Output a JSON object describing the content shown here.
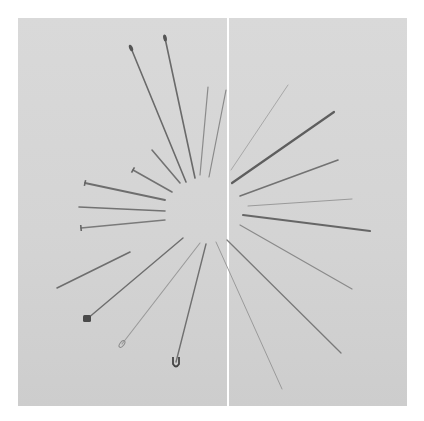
{
  "image": {
    "subject": "Assorted pins and needles arranged radially in a starburst pattern",
    "background_color": "#d6d6d6",
    "seam_color": "#ffffff",
    "needle_color": "#6e6e6e"
  },
  "needles": [
    {
      "x1": 131,
      "y1": 48,
      "x2": 186,
      "y2": 182,
      "w": 1.6,
      "c": "#6a6a6a",
      "head": "eye"
    },
    {
      "x1": 165,
      "y1": 38,
      "x2": 195,
      "y2": 178,
      "w": 1.6,
      "c": "#6a6a6a",
      "head": "eye"
    },
    {
      "x1": 208,
      "y1": 87,
      "x2": 200,
      "y2": 175,
      "w": 1.2,
      "c": "#8a8a8a",
      "head": "none"
    },
    {
      "x1": 226,
      "y1": 90,
      "x2": 209,
      "y2": 177,
      "w": 1.2,
      "c": "#8a8a8a",
      "head": "none"
    },
    {
      "x1": 152,
      "y1": 150,
      "x2": 180,
      "y2": 183,
      "w": 1.6,
      "c": "#727272",
      "head": "none"
    },
    {
      "x1": 133,
      "y1": 170,
      "x2": 172,
      "y2": 192,
      "w": 1.6,
      "c": "#727272",
      "head": "flat"
    },
    {
      "x1": 85,
      "y1": 183,
      "x2": 165,
      "y2": 200,
      "w": 1.8,
      "c": "#6e6e6e",
      "head": "flat"
    },
    {
      "x1": 79,
      "y1": 207,
      "x2": 165,
      "y2": 211,
      "w": 1.6,
      "c": "#727272",
      "head": "none"
    },
    {
      "x1": 81,
      "y1": 228,
      "x2": 165,
      "y2": 220,
      "w": 1.4,
      "c": "#7a7a7a",
      "head": "flat"
    },
    {
      "x1": 57,
      "y1": 288,
      "x2": 130,
      "y2": 252,
      "w": 1.6,
      "c": "#6e6e6e",
      "head": "none"
    },
    {
      "x1": 87,
      "y1": 319,
      "x2": 183,
      "y2": 238,
      "w": 1.4,
      "c": "#6e6e6e",
      "head": "knob"
    },
    {
      "x1": 122,
      "y1": 344,
      "x2": 200,
      "y2": 243,
      "w": 1.1,
      "c": "#9a9a9a",
      "head": "oval"
    },
    {
      "x1": 176,
      "y1": 362,
      "x2": 206,
      "y2": 244,
      "w": 1.4,
      "c": "#707070",
      "head": "safety"
    },
    {
      "x1": 231,
      "y1": 170,
      "x2": 288,
      "y2": 85,
      "w": 1.0,
      "c": "#a8a8a8",
      "head": "none"
    },
    {
      "x1": 232,
      "y1": 183,
      "x2": 334,
      "y2": 112,
      "w": 2.2,
      "c": "#5e5e5e",
      "head": "none"
    },
    {
      "x1": 240,
      "y1": 196,
      "x2": 338,
      "y2": 160,
      "w": 1.6,
      "c": "#727272",
      "head": "none"
    },
    {
      "x1": 248,
      "y1": 206,
      "x2": 352,
      "y2": 199,
      "w": 1.0,
      "c": "#9a9a9a",
      "head": "none"
    },
    {
      "x1": 243,
      "y1": 215,
      "x2": 370,
      "y2": 231,
      "w": 2.0,
      "c": "#666666",
      "head": "none"
    },
    {
      "x1": 240,
      "y1": 225,
      "x2": 352,
      "y2": 289,
      "w": 1.2,
      "c": "#8a8a8a",
      "head": "none"
    },
    {
      "x1": 227,
      "y1": 240,
      "x2": 341,
      "y2": 353,
      "w": 1.3,
      "c": "#7a7a7a",
      "head": "none"
    },
    {
      "x1": 216,
      "y1": 242,
      "x2": 282,
      "y2": 389,
      "w": 1.0,
      "c": "#9a9a9a",
      "head": "none"
    }
  ]
}
